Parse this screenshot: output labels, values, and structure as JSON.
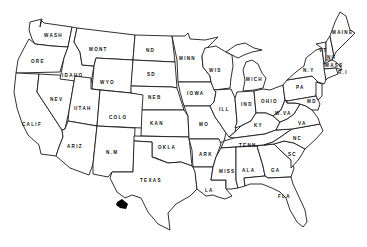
{
  "map": {
    "title": "",
    "type": "outline map of the United States",
    "colors": {
      "background": "#ffffff",
      "border": "#1a1a1a",
      "label": "#111111",
      "marker": "#000000"
    },
    "marker": {
      "description": "black filled shape near Texas-Mexico border (Big Bend region)",
      "x": 122,
      "y": 205
    },
    "states": [
      {
        "id": "wash",
        "label": "WASH",
        "x": 45,
        "y": 37
      },
      {
        "id": "ore",
        "label": "ORE",
        "x": 32,
        "y": 63
      },
      {
        "id": "calif",
        "label": "CALIF",
        "x": 27,
        "y": 126
      },
      {
        "id": "idaho",
        "label": "IDAHO",
        "x": 62,
        "y": 76
      },
      {
        "id": "nev",
        "label": "NEV",
        "x": 53,
        "y": 100
      },
      {
        "id": "mont",
        "label": "MONT",
        "x": 96,
        "y": 50
      },
      {
        "id": "wyo",
        "label": "WYO",
        "x": 103,
        "y": 84
      },
      {
        "id": "utah",
        "label": "UTAH",
        "x": 79,
        "y": 109
      },
      {
        "id": "colo",
        "label": "COLO",
        "x": 112,
        "y": 118
      },
      {
        "id": "ariz",
        "label": "ARIZ",
        "x": 70,
        "y": 147
      },
      {
        "id": "nm",
        "label": "N.M",
        "x": 106,
        "y": 154
      },
      {
        "id": "nd",
        "label": "ND",
        "x": 147,
        "y": 52
      },
      {
        "id": "sd",
        "label": "SD",
        "x": 148,
        "y": 76
      },
      {
        "id": "neb",
        "label": "NEB",
        "x": 150,
        "y": 98
      },
      {
        "id": "kan",
        "label": "KAN",
        "x": 153,
        "y": 124
      },
      {
        "id": "okla",
        "label": "OKLA",
        "x": 162,
        "y": 148
      },
      {
        "id": "texas",
        "label": "TEXAS",
        "x": 145,
        "y": 182
      },
      {
        "id": "minn",
        "label": "MINN",
        "x": 186,
        "y": 59
      },
      {
        "id": "iowa",
        "label": "IOWA",
        "x": 190,
        "y": 94
      },
      {
        "id": "mo",
        "label": "MO",
        "x": 202,
        "y": 126
      },
      {
        "id": "ark",
        "label": "ARK",
        "x": 204,
        "y": 155
      },
      {
        "id": "la",
        "label": "LA",
        "x": 206,
        "y": 192
      },
      {
        "id": "wis",
        "label": "WIS",
        "x": 213,
        "y": 71
      },
      {
        "id": "ill",
        "label": "ILL",
        "x": 222,
        "y": 110
      },
      {
        "id": "mich",
        "label": "MICH",
        "x": 253,
        "y": 80
      },
      {
        "id": "ind",
        "label": "IND",
        "x": 246,
        "y": 105
      },
      {
        "id": "ohio",
        "label": "OHIO",
        "x": 267,
        "y": 102
      },
      {
        "id": "ky",
        "label": "KY",
        "x": 256,
        "y": 127
      },
      {
        "id": "tenn",
        "label": "TENN",
        "x": 247,
        "y": 146
      },
      {
        "id": "miss",
        "label": "MISS",
        "x": 226,
        "y": 172
      },
      {
        "id": "ala",
        "label": "ALA",
        "x": 246,
        "y": 171
      },
      {
        "id": "ga",
        "label": "GA",
        "x": 273,
        "y": 172
      },
      {
        "id": "fla",
        "label": "FLA",
        "x": 282,
        "y": 197
      },
      {
        "id": "sc",
        "label": "SC",
        "x": 290,
        "y": 155
      },
      {
        "id": "nc",
        "label": "NC",
        "x": 296,
        "y": 139
      },
      {
        "id": "va",
        "label": "VA",
        "x": 300,
        "y": 124
      },
      {
        "id": "wva",
        "label": "W.VA",
        "x": 278,
        "y": 114
      },
      {
        "id": "pa",
        "label": "PA",
        "x": 298,
        "y": 88
      },
      {
        "id": "ny",
        "label": "N.Y",
        "x": 306,
        "y": 71
      },
      {
        "id": "vt",
        "label": "VT",
        "x": 322,
        "y": 50
      },
      {
        "id": "nh",
        "label": "NH",
        "x": 330,
        "y": 57
      },
      {
        "id": "maine",
        "label": "MAINE",
        "x": 340,
        "y": 33
      },
      {
        "id": "mass",
        "label": "MASS",
        "x": 330,
        "y": 66
      },
      {
        "id": "ri",
        "label": "R.I",
        "x": 342,
        "y": 73
      },
      {
        "id": "md",
        "label": "MD",
        "x": 311,
        "y": 102
      }
    ]
  }
}
